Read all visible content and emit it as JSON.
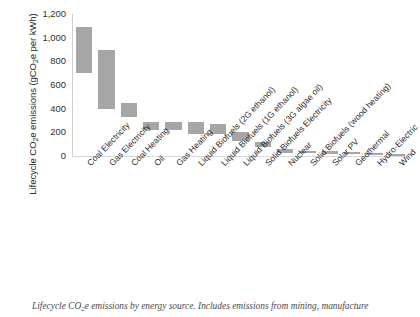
{
  "chart_data": {
    "type": "bar",
    "bar_style": "floating-range",
    "title": "",
    "xlabel": "",
    "ylabel": "Lifecycle CO2e emissions (gCO2e per kWh)",
    "ylabel_display": "Lifecycle CO₂e emissions (gCO₂e per kWh)",
    "ylim": [
      0,
      1200
    ],
    "ytick_step": 200,
    "ytick_labels": [
      "1,200",
      "1,000",
      "800",
      "600",
      "400",
      "200",
      "0"
    ],
    "ytick_values": [
      1200,
      1000,
      800,
      600,
      400,
      200,
      0
    ],
    "grid": false,
    "legend": "none",
    "bar_color": "#a6a6a6",
    "units": "gCO2e per kWh",
    "categories": [
      "Coal Electricity",
      "Gas Electricity",
      "Coal Heating",
      "Oil",
      "Gas Heating",
      "Liquid Biofuels (2G ethanol)",
      "Liquid Biofuels (1G ethanol)",
      "Liquid Biofuels (3G algae oil)",
      "Solid Biofuels Electricity",
      "Nuclear",
      "Solid Biofuels (wood heating)",
      "Solar PV",
      "Geothermal",
      "Hydro-Electric",
      "Wind"
    ],
    "ranges": [
      {
        "category": "Coal Electricity",
        "low": 700,
        "high": 1090
      },
      {
        "category": "Gas Electricity",
        "low": 400,
        "high": 900
      },
      {
        "category": "Coal Heating",
        "low": 330,
        "high": 450
      },
      {
        "category": "Oil",
        "low": 220,
        "high": 285
      },
      {
        "category": "Gas Heating",
        "low": 220,
        "high": 285
      },
      {
        "category": "Liquid Biofuels (2G ethanol)",
        "low": 190,
        "high": 285
      },
      {
        "category": "Liquid Biofuels (1G ethanol)",
        "low": 190,
        "high": 270
      },
      {
        "category": "Liquid Biofuels (3G algae oil)",
        "low": 130,
        "high": 200
      },
      {
        "category": "Solid Biofuels Electricity",
        "low": 75,
        "high": 120
      },
      {
        "category": "Nuclear",
        "low": 28,
        "high": 55
      },
      {
        "category": "Solid Biofuels (wood heating)",
        "low": 22,
        "high": 42
      },
      {
        "category": "Solar PV",
        "low": 20,
        "high": 40
      },
      {
        "category": "Geothermal",
        "low": 18,
        "high": 38
      },
      {
        "category": "Hydro-Electric",
        "low": 12,
        "high": 26
      },
      {
        "category": "Wind",
        "low": 4,
        "high": 14
      }
    ]
  },
  "caption": {
    "text": "Lifecycle CO₂e emissions by energy source. Includes emissions from mining, manufacture"
  }
}
